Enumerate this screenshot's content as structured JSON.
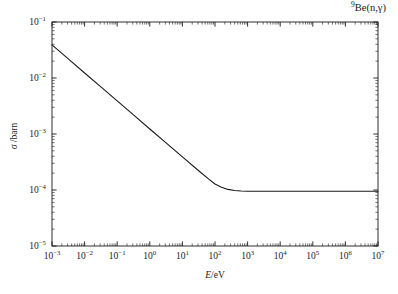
{
  "title": {
    "isotope_mass": "9",
    "element": "Be",
    "reaction": "(n,γ)"
  },
  "axes": {
    "x": {
      "label": "E/eV",
      "label_italic_part": "E",
      "label_rest": "/eV",
      "ticks": [
        "10⁻³",
        "10⁻²",
        "10⁻¹",
        "10⁰",
        "10¹",
        "10²",
        "10³",
        "10⁴",
        "10⁵",
        "10⁶",
        "10⁷"
      ],
      "tick_mantissa": "10",
      "tick_exponents": [
        "-3",
        "-2",
        "-1",
        "0",
        "1",
        "2",
        "3",
        "4",
        "5",
        "6",
        "7"
      ],
      "scale": "log",
      "min_exp": -3,
      "max_exp": 7
    },
    "y": {
      "label": "σ / barn",
      "label_symbol": "σ",
      "label_rest": "/barn",
      "ticks": [
        "10⁻¹",
        "10⁻²",
        "10⁻³",
        "10⁻⁴",
        "10⁻⁵"
      ],
      "tick_mantissa": "10",
      "tick_exponents": [
        "-1",
        "-2",
        "-3",
        "-4",
        "-5"
      ],
      "scale": "log",
      "min_exp": -5,
      "max_exp": -1
    }
  },
  "style": {
    "line_color": "#1a1a1a",
    "axis_color": "#1a1a1a",
    "background": "#ffffff",
    "line_width": 1.1,
    "grid": "off",
    "legend": "none",
    "minor_ticks": "on",
    "tick_direction": "in"
  },
  "chart_data": {
    "type": "line",
    "title": "9Be(n,γ)",
    "xlabel": "E/eV",
    "ylabel": "σ / barn",
    "xscale": "log",
    "yscale": "log",
    "xlim": [
      0.001,
      10000000
    ],
    "ylim": [
      1e-05,
      0.1
    ],
    "grid": false,
    "legend_position": "none",
    "annotations": [
      "9Be(n,gamma) radiative capture cross section"
    ],
    "series": [
      {
        "name": "σ(n,γ)",
        "x": [
          0.001,
          0.00316,
          0.01,
          0.0316,
          0.1,
          0.316,
          1.0,
          3.16,
          10.0,
          31.6,
          63.0,
          100.0,
          158.0,
          251.0,
          398.0,
          631.0,
          1000.0,
          3160.0,
          10000.0,
          31600.0,
          100000.0,
          316000.0,
          1000000.0,
          3160000.0,
          10000000.0
        ],
        "y": [
          0.039,
          0.0219,
          0.0123,
          0.00693,
          0.0039,
          0.00219,
          0.00123,
          0.000693,
          0.00039,
          0.000221,
          0.000158,
          0.000128,
          0.000112,
          0.0001025,
          9.8e-05,
          9.6e-05,
          9.5e-05,
          9.5e-05,
          9.5e-05,
          9.5e-05,
          9.5e-05,
          9.5e-05,
          9.5e-05,
          9.5e-05,
          9.5e-05
        ]
      }
    ]
  }
}
